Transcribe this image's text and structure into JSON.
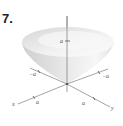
{
  "figure": {
    "problem_number": "7.",
    "surface": "inverted cone",
    "axes": {
      "x_label": "x",
      "y_label": "y",
      "z_label": "z"
    },
    "ticks": {
      "z_a": "a",
      "x_neg_a": "−a",
      "x_a": "a",
      "y_neg_a": "−a",
      "y_a": "a"
    },
    "colors": {
      "surface_light": "#f4f4f4",
      "surface_dark": "#c8c8c8",
      "axis": "#555555"
    }
  }
}
